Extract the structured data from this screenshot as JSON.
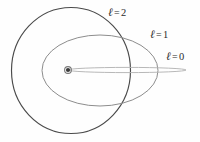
{
  "figure": {
    "background_color": "#fefefe",
    "width": 200,
    "height": 142
  },
  "nucleus": {
    "name": "nucleus",
    "cx": 68,
    "cy": 70,
    "dot_radius": 2.1,
    "ring_radius": 3.4,
    "color": "#3a3a3a",
    "ring_color": "#7a7a7a"
  },
  "labels": {
    "l2": {
      "symbol": "ℓ",
      "equals": "=",
      "value": "2"
    },
    "l1": {
      "symbol": "ℓ",
      "equals": "=",
      "value": "1"
    },
    "l0": {
      "symbol": "ℓ",
      "equals": "=",
      "value": "0"
    }
  },
  "chart_data": {
    "type": "scatter",
    "subtitle": "",
    "xlabel": "",
    "ylabel": "",
    "grid": false,
    "legend_position": "inline-annotations",
    "xlim": [
      0,
      200
    ],
    "ylim": [
      0,
      142
    ],
    "annotations": [
      {
        "text": "ℓ = 2",
        "x": 110,
        "y": 12
      },
      {
        "text": "ℓ = 1",
        "x": 152,
        "y": 34
      },
      {
        "text": "ℓ = 0",
        "x": 168,
        "y": 56
      }
    ],
    "series": [
      {
        "name": "ℓ = 2",
        "shape": "circle",
        "cx": 71,
        "cy": 70.5,
        "rx": 59.5,
        "ry": 63,
        "eccentricity": 0.0,
        "stroke": "#4a4a4a",
        "stroke_width": 1.15,
        "fill": "none"
      },
      {
        "name": "ℓ = 1",
        "shape": "ellipse",
        "cx": 100,
        "cy": 70.5,
        "rx": 58,
        "ry": 35.5,
        "eccentricity": 0.79,
        "stroke": "#8d8d8d",
        "stroke_width": 1.0,
        "fill": "none"
      },
      {
        "name": "ℓ = 0",
        "shape": "degenerate-ellipse",
        "cx": 127,
        "cy": 70,
        "rx": 59,
        "ry": 2.6,
        "eccentricity": 1.0,
        "stroke": "#b4b4b4",
        "stroke_width": 0.95,
        "fill": "none"
      }
    ]
  }
}
